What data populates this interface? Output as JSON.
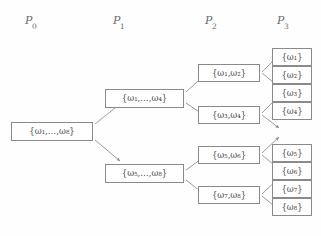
{
  "figure": {
    "type": "partition-refinement-tree",
    "line_color": "#8e8e8e",
    "box_border_color": "#8a8a8a",
    "text_color": "#4a4a4a",
    "background": "#fefefe"
  },
  "columns": [
    {
      "id": "P0",
      "label_base": "P",
      "label_sub": "0",
      "x": 25,
      "y": 14
    },
    {
      "id": "P1",
      "label_base": "P",
      "label_sub": "1",
      "x": 113,
      "y": 14
    },
    {
      "id": "P2",
      "label_base": "P",
      "label_sub": "2",
      "x": 205,
      "y": 14
    },
    {
      "id": "P3",
      "label_base": "P",
      "label_sub": "3",
      "x": 277,
      "y": 14
    }
  ],
  "nodes": {
    "p0_root": {
      "text": "{ω₁,…,ω₈}",
      "elements": [
        "ω₁",
        "…",
        "ω₈"
      ],
      "column": "P0",
      "x": 11,
      "y": 122,
      "w": 82,
      "h": 19
    },
    "p1_top": {
      "text": "{ω₁,…,ω₄}",
      "elements": [
        "ω₁",
        "…",
        "ω₄"
      ],
      "column": "P1",
      "x": 105,
      "y": 89,
      "w": 79,
      "h": 19
    },
    "p1_bottom": {
      "text": "{ω₅,…,ω₈}",
      "elements": [
        "ω₅",
        "…",
        "ω₈"
      ],
      "column": "P1",
      "x": 105,
      "y": 164,
      "w": 79,
      "h": 19
    },
    "p2_a": {
      "text": "{ω₁,ω₂}",
      "elements": [
        "ω₁",
        "ω₂"
      ],
      "column": "P2",
      "x": 198,
      "y": 64,
      "w": 62,
      "h": 18
    },
    "p2_b": {
      "text": "{ω₃,ω₄}",
      "elements": [
        "ω₃",
        "ω₄"
      ],
      "column": "P2",
      "x": 198,
      "y": 106,
      "w": 62,
      "h": 18
    },
    "p2_c": {
      "text": "{ω₅,ω₆}",
      "elements": [
        "ω₅",
        "ω₆"
      ],
      "column": "P2",
      "x": 198,
      "y": 146,
      "w": 62,
      "h": 18
    },
    "p2_d": {
      "text": "{ω₇,ω₈}",
      "elements": [
        "ω₇",
        "ω₈"
      ],
      "column": "P2",
      "x": 198,
      "y": 186,
      "w": 62,
      "h": 18
    },
    "p3_1": {
      "text": "{ω₁}",
      "elements": [
        "ω₁"
      ],
      "column": "P3",
      "x": 272,
      "y": 48,
      "w": 40,
      "h": 18
    },
    "p3_2": {
      "text": "{ω₂}",
      "elements": [
        "ω₂"
      ],
      "column": "P3",
      "x": 272,
      "y": 66,
      "w": 40,
      "h": 18
    },
    "p3_3": {
      "text": "{ω₃}",
      "elements": [
        "ω₃"
      ],
      "column": "P3",
      "x": 272,
      "y": 84,
      "w": 40,
      "h": 18
    },
    "p3_4": {
      "text": "{ω₄}",
      "elements": [
        "ω₄"
      ],
      "column": "P3",
      "x": 272,
      "y": 102,
      "w": 40,
      "h": 18
    },
    "p3_5": {
      "text": "{ω₅}",
      "elements": [
        "ω₅"
      ],
      "column": "P3",
      "x": 272,
      "y": 144,
      "w": 40,
      "h": 18
    },
    "p3_6": {
      "text": "{ω₆}",
      "elements": [
        "ω₆"
      ],
      "column": "P3",
      "x": 272,
      "y": 162,
      "w": 40,
      "h": 18
    },
    "p3_7": {
      "text": "{ω₇}",
      "elements": [
        "ω₇"
      ],
      "column": "P3",
      "x": 272,
      "y": 180,
      "w": 40,
      "h": 18
    },
    "p3_8": {
      "text": "{ω₈}",
      "elements": [
        "ω₈"
      ],
      "column": "P3",
      "x": 272,
      "y": 198,
      "w": 40,
      "h": 18
    }
  },
  "edges": [
    {
      "from": "p0_root",
      "to": "p1_top",
      "x1": 95,
      "y1": 124,
      "x2": 120,
      "y2": 104
    },
    {
      "from": "p0_root",
      "to": "p1_bottom",
      "x1": 95,
      "y1": 140,
      "x2": 120,
      "y2": 161
    },
    {
      "from": "p1_top",
      "to": "p2_a",
      "x1": 186,
      "y1": 92,
      "x2": 208,
      "y2": 72
    },
    {
      "from": "p1_top",
      "to": "p2_b",
      "x1": 186,
      "y1": 103,
      "x2": 208,
      "y2": 118
    },
    {
      "from": "p1_bottom",
      "to": "p2_c",
      "x1": 186,
      "y1": 170,
      "x2": 208,
      "y2": 154
    },
    {
      "from": "p1_bottom",
      "to": "p2_d",
      "x1": 186,
      "y1": 180,
      "x2": 208,
      "y2": 197
    },
    {
      "from": "p2_a",
      "to": "p3_1",
      "x1": 262,
      "y1": 72,
      "x2": 279,
      "y2": 55
    },
    {
      "from": "p2_a",
      "to": "p3_2",
      "x1": 262,
      "y1": 73,
      "x2": 279,
      "y2": 87
    },
    {
      "from": "p2_b",
      "to": "p3_3",
      "x1": 262,
      "y1": 113,
      "x2": 279,
      "y2": 96
    },
    {
      "from": "p2_b",
      "to": "p3_4",
      "x1": 262,
      "y1": 115,
      "x2": 279,
      "y2": 128
    },
    {
      "from": "p2_c",
      "to": "p3_5",
      "x1": 262,
      "y1": 153,
      "x2": 279,
      "y2": 137
    },
    {
      "from": "p2_c",
      "to": "p3_6",
      "x1": 262,
      "y1": 155,
      "x2": 279,
      "y2": 169
    },
    {
      "from": "p2_d",
      "to": "p3_7",
      "x1": 262,
      "y1": 194,
      "x2": 279,
      "y2": 178
    },
    {
      "from": "p2_d",
      "to": "p3_8",
      "x1": 262,
      "y1": 196,
      "x2": 279,
      "y2": 210
    }
  ]
}
